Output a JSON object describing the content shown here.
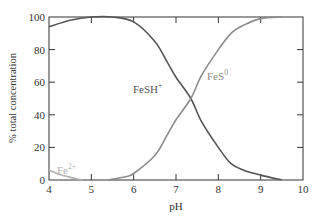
{
  "chart_data": {
    "type": "line",
    "title": "",
    "xlabel": "pH",
    "ylabel": "% total concentration",
    "xlim": [
      4,
      10
    ],
    "ylim": [
      0,
      100
    ],
    "xticks": [
      4,
      5,
      6,
      7,
      8,
      9,
      10
    ],
    "yticks": [
      0,
      20,
      40,
      60,
      80,
      100
    ],
    "grid": false,
    "legend": "inline labels",
    "series": [
      {
        "name": "FeSH+",
        "label_main": "FeSH",
        "label_sup": "+",
        "color": "#555555",
        "x": [
          4.0,
          4.5,
          5.0,
          5.5,
          6.0,
          6.5,
          6.8,
          7.0,
          7.35,
          7.6,
          8.0,
          8.3,
          8.6,
          9.0,
          9.5
        ],
        "y": [
          94,
          98,
          100,
          100,
          97,
          85,
          72,
          63,
          50,
          36,
          20,
          10,
          6,
          3,
          0
        ]
      },
      {
        "name": "FeS0",
        "label_main": "FeS",
        "label_sup": "0",
        "color": "#8c8c8c",
        "x": [
          5.4,
          5.8,
          6.0,
          6.5,
          6.8,
          7.0,
          7.35,
          7.6,
          8.0,
          8.3,
          8.6,
          9.0,
          9.5
        ],
        "y": [
          0,
          2,
          4,
          15,
          28,
          37,
          50,
          64,
          80,
          90,
          95,
          99,
          100
        ]
      },
      {
        "name": "Fe2+",
        "label_main": "Fe",
        "label_sup": "2+",
        "color": "#b0b0b0",
        "x": [
          4.0,
          4.3,
          4.6,
          4.8
        ],
        "y": [
          6,
          3,
          1,
          0
        ]
      }
    ]
  }
}
